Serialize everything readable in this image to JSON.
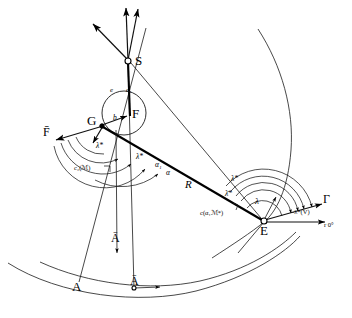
{
  "figure": {
    "kind": "geometric-vector-diagram",
    "background_color": "#ffffff",
    "ink_color": "#000000",
    "width": 352,
    "height": 318
  },
  "points": [
    {
      "id": "S",
      "label": "S",
      "x": 128,
      "y": 60,
      "marker": "open-circle"
    },
    {
      "id": "F",
      "label": "F",
      "x": 131,
      "y": 114,
      "marker": "none"
    },
    {
      "id": "G",
      "label": "G",
      "x": 101,
      "y": 124,
      "marker": "dot"
    },
    {
      "id": "E",
      "label": "E",
      "x": 263,
      "y": 221,
      "marker": "open-circle"
    },
    {
      "id": "A",
      "label": "A",
      "x": 78,
      "y": 283,
      "marker": "none"
    },
    {
      "id": "Abar_axis",
      "label": "Ā",
      "x": 133,
      "y": 267,
      "marker": "none"
    },
    {
      "id": "Abar_ground",
      "label": "Ā",
      "x": 134,
      "y": 287,
      "marker": "dot-small"
    }
  ],
  "labels": {
    "point_S": "S",
    "point_F": "F",
    "point_G": "G",
    "point_E": "E",
    "point_A": "A",
    "vector_A_upper": "Ā",
    "vector_A_lower": "Ā",
    "vector_F_bar": "F̄",
    "segment_R": "R",
    "basis_e": "e",
    "basis_e1": "e₁",
    "angle_lambda_star_G": "λ*",
    "angle_lambda_star_G_left": "λ*",
    "angle_alpha1": "α₁",
    "angle_alpha": "α",
    "angle_lambda_star_E": "λ*",
    "angle_lambda_bar_star_E": "λ̄*",
    "angle_lambda_E": "λ",
    "angle_b_GF": "b",
    "curve_c2": "c₂(ℳ)",
    "curve_c_alpha": "c(α₁ℳ*)",
    "label_minus_lambda_star_V": "-λ*(V)",
    "label_Gamma": "Γ",
    "label_r_zero": "r 0°"
  },
  "rays_from_S": [
    {
      "id": "ray-up-left",
      "label": "upper-left ray",
      "arrow": true
    },
    {
      "id": "ray-up-vertical",
      "label": "vertical ray",
      "arrow": true
    },
    {
      "id": "ray-up-right",
      "label": "upper-right ray",
      "arrow": true
    }
  ],
  "curves": {
    "ground_arc_outer": "outer ground arc",
    "ground_arc_inner": "inner ground arc",
    "trajectory_curve": "long sweeping trajectory through E",
    "circle_at_F": "small circle centered near F"
  },
  "angle_arcs_at_G": 4,
  "angle_arcs_at_E": 4
}
